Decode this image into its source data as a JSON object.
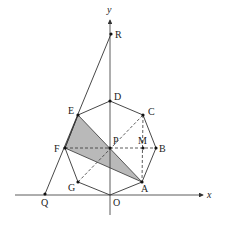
{
  "diagram": {
    "title": "",
    "axes": {
      "x_label": "x",
      "y_label": "y"
    },
    "points": {
      "O": {
        "label": "O",
        "x": 110,
        "y": 195
      },
      "A": {
        "label": "A",
        "x": 142,
        "y": 182
      },
      "B": {
        "label": "B",
        "x": 156,
        "y": 148
      },
      "C": {
        "label": "C",
        "x": 143,
        "y": 115
      },
      "D": {
        "label": "D",
        "x": 110,
        "y": 101
      },
      "E": {
        "label": "E",
        "x": 78,
        "y": 115
      },
      "F": {
        "label": "F",
        "x": 65,
        "y": 148
      },
      "G": {
        "label": "G",
        "x": 78,
        "y": 182
      },
      "P": {
        "label": "P",
        "x": 110,
        "y": 148
      },
      "M": {
        "label": "M",
        "x": 143,
        "y": 148
      },
      "Q": {
        "label": "Q",
        "x": 45,
        "y": 194
      },
      "R": {
        "label": "R",
        "x": 111,
        "y": 34
      }
    },
    "shapes": {
      "octagon": "OABCDEFG",
      "shaded_triangle": "AEF",
      "line_QR": "through Q, F, E, R",
      "dashed_segments": [
        "F-B",
        "G-C",
        "C-A"
      ]
    },
    "colors": {
      "stroke": "#333333",
      "shade": "#b9b9b9",
      "background": "#ffffff"
    }
  }
}
